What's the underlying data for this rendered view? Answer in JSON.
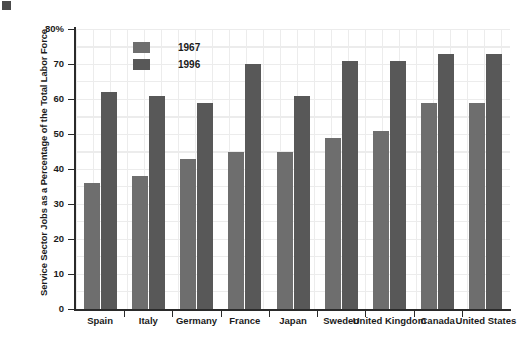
{
  "chart_data": {
    "type": "bar",
    "title": "",
    "xlabel": "",
    "ylabel": "Service Sector Jobs as a Percentage of the Total Labor Force",
    "ylim": [
      0,
      80
    ],
    "yticks": [
      "0",
      "10",
      "20",
      "30",
      "40",
      "50",
      "60",
      "70",
      "80%"
    ],
    "grid": true,
    "legend_position": "top-center",
    "categories": [
      "Spain",
      "Italy",
      "Germany",
      "France",
      "Japan",
      "Sweden",
      "United Kingdom",
      "Canada",
      "United States"
    ],
    "series": [
      {
        "name": "1967",
        "color": "#6e6e6e",
        "values": [
          36,
          38,
          43,
          45,
          45,
          49,
          51,
          59,
          59
        ]
      },
      {
        "name": "1996",
        "color": "#585858",
        "values": [
          62,
          61,
          59,
          70,
          61,
          71,
          71,
          73,
          73
        ]
      }
    ]
  },
  "legend": {
    "items": [
      {
        "label": "1967",
        "color": "#6e6e6e"
      },
      {
        "label": "1996",
        "color": "#585858"
      }
    ]
  },
  "axis": {
    "y_title": "Service Sector Jobs as a Percentage of the Total Labor Force"
  }
}
